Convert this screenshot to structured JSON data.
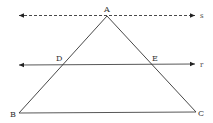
{
  "diagram": {
    "type": "geometry",
    "colors": {
      "stroke": "#333333",
      "background": "#ffffff"
    },
    "points": {
      "A": {
        "label": "A",
        "x": 107,
        "y": 16
      },
      "B": {
        "label": "B",
        "x": 19,
        "y": 113
      },
      "C": {
        "label": "C",
        "x": 196,
        "y": 112
      },
      "D": {
        "label": "D",
        "x": 62,
        "y": 65
      },
      "E": {
        "label": "E",
        "x": 152,
        "y": 65
      }
    },
    "lines": {
      "s": {
        "label": "s",
        "style": "dashed",
        "y": 15,
        "x1": 18,
        "x2": 196
      },
      "r": {
        "label": "r",
        "style": "solid",
        "y": 65,
        "x1": 18,
        "x2": 196
      }
    },
    "segments": [
      "AB",
      "AC",
      "BC"
    ]
  }
}
